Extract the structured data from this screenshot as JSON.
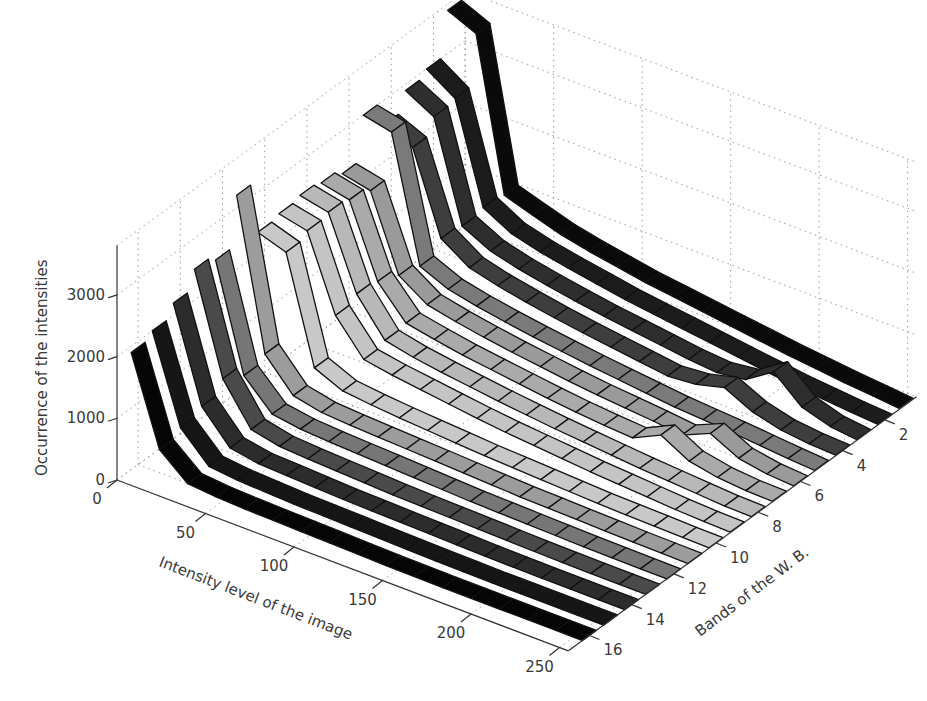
{
  "chart_data": {
    "type": "ribbon3d",
    "title": "",
    "xlabel": "Intensity level of the image",
    "ylabel": "Bands of the W. B.",
    "zlabel": "Occurrence of the intensities",
    "x_ticks": [
      0,
      50,
      100,
      150,
      200,
      250
    ],
    "y_ticks": [
      2,
      4,
      6,
      8,
      10,
      12,
      14,
      16
    ],
    "z_ticks": [
      0,
      1000,
      2000,
      3000
    ],
    "xlim": [
      0,
      255
    ],
    "ylim": [
      1,
      16
    ],
    "zlim": [
      0,
      3800
    ],
    "grid": true,
    "colormap": "gray",
    "x": [
      0,
      16,
      32,
      48,
      64,
      80,
      96,
      112,
      128,
      144,
      160,
      176,
      192,
      208,
      224,
      240,
      255
    ],
    "series": [
      {
        "name": "Band 1",
        "shade": "#0a0a0a",
        "values": [
          3700,
          3500,
          1050,
          900,
          760,
          660,
          580,
          500,
          440,
          380,
          320,
          260,
          200,
          150,
          100,
          60,
          20
        ]
      },
      {
        "name": "Band 2",
        "shade": "#1c1c1c",
        "values": [
          3000,
          2700,
          1100,
          850,
          730,
          640,
          560,
          480,
          420,
          360,
          300,
          240,
          180,
          120,
          80,
          40,
          10
        ]
      },
      {
        "name": "Band 3",
        "shade": "#2e2e2e",
        "values": [
          2900,
          2650,
          1050,
          820,
          700,
          610,
          530,
          460,
          400,
          340,
          280,
          240,
          300,
          600,
          200,
          60,
          10
        ]
      },
      {
        "name": "Band 4",
        "shade": "#3e3e3e",
        "values": [
          2600,
          2400,
          1100,
          800,
          680,
          590,
          510,
          440,
          380,
          320,
          260,
          300,
          420,
          200,
          80,
          30,
          10
        ]
      },
      {
        "name": "Band 5",
        "shade": "#7a7a7a",
        "values": [
          3000,
          2900,
          900,
          700,
          600,
          520,
          450,
          390,
          330,
          280,
          230,
          180,
          150,
          120,
          80,
          40,
          10
        ]
      },
      {
        "name": "Band 6",
        "shade": "#9a9a9a",
        "values": [
          2300,
          2200,
          1000,
          700,
          600,
          520,
          450,
          390,
          330,
          280,
          240,
          200,
          150,
          350,
          120,
          40,
          10
        ]
      },
      {
        "name": "Band 7",
        "shade": "#aaaaaa",
        "values": [
          2400,
          2300,
          1150,
          650,
          560,
          480,
          420,
          360,
          300,
          250,
          210,
          180,
          400,
          150,
          60,
          20,
          10
        ]
      },
      {
        "name": "Band 8",
        "shade": "#b8b8b8",
        "values": [
          2450,
          2350,
          1200,
          620,
          520,
          450,
          390,
          330,
          280,
          230,
          190,
          150,
          110,
          80,
          50,
          20,
          10
        ]
      },
      {
        "name": "Band 9",
        "shade": "#c4c4c4",
        "values": [
          2400,
          2300,
          1100,
          560,
          480,
          420,
          360,
          300,
          250,
          210,
          170,
          130,
          100,
          70,
          40,
          20,
          10
        ]
      },
      {
        "name": "Band 10",
        "shade": "#c8c8c8",
        "values": [
          2350,
          2200,
          500,
          300,
          250,
          210,
          180,
          150,
          120,
          100,
          80,
          60,
          40,
          30,
          20,
          10,
          5
        ]
      },
      {
        "name": "Band 11",
        "shade": "#9c9c9c",
        "values": [
          3200,
          800,
          300,
          200,
          170,
          150,
          130,
          110,
          90,
          70,
          50,
          40,
          30,
          20,
          10,
          5,
          0
        ]
      },
      {
        "name": "Band 12",
        "shade": "#767676",
        "values": [
          2400,
          700,
          250,
          180,
          150,
          130,
          110,
          90,
          70,
          50,
          40,
          30,
          20,
          10,
          5,
          0,
          0
        ]
      },
      {
        "name": "Band 13",
        "shade": "#4a4a4a",
        "values": [
          2500,
          900,
          250,
          150,
          120,
          100,
          80,
          60,
          50,
          40,
          30,
          20,
          10,
          5,
          0,
          0,
          0
        ]
      },
      {
        "name": "Band 14",
        "shade": "#2c2c2c",
        "values": [
          2200,
          700,
          200,
          120,
          100,
          80,
          60,
          50,
          40,
          30,
          20,
          10,
          5,
          0,
          0,
          0,
          0
        ]
      },
      {
        "name": "Band 15",
        "shade": "#161616",
        "values": [
          2000,
          600,
          150,
          100,
          80,
          60,
          50,
          40,
          30,
          20,
          10,
          5,
          0,
          0,
          0,
          0,
          0
        ]
      },
      {
        "name": "Band 16",
        "shade": "#050505",
        "values": [
          1900,
          500,
          120,
          80,
          60,
          50,
          40,
          30,
          20,
          10,
          5,
          0,
          0,
          0,
          0,
          0,
          0
        ]
      }
    ]
  }
}
